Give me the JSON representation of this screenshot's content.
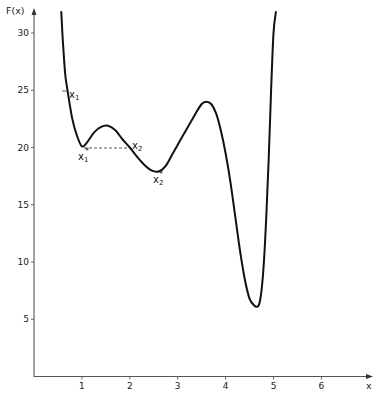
{
  "chart_data": {
    "type": "line",
    "title": "",
    "xlabel": "x",
    "ylabel": "F(x)",
    "xlim": [
      0,
      7
    ],
    "ylim": [
      0,
      32
    ],
    "x_ticks": [
      1,
      2,
      3,
      4,
      5,
      6
    ],
    "y_ticks": [
      5,
      10,
      15,
      20,
      25,
      30
    ],
    "x_tick_labels": [
      "1",
      "2",
      "3",
      "4",
      "5",
      "6"
    ],
    "y_tick_labels": [
      "5",
      "10",
      "15",
      "20",
      "25",
      "30"
    ],
    "grid": false,
    "legend": null,
    "series": [
      {
        "name": "F(x)",
        "x": [
          0.57,
          0.6,
          0.65,
          0.7,
          0.8,
          0.9,
          1.0,
          1.1,
          1.25,
          1.4,
          1.55,
          1.7,
          1.85,
          2.0,
          2.15,
          2.3,
          2.45,
          2.6,
          2.75,
          2.9,
          3.05,
          3.2,
          3.35,
          3.5,
          3.6,
          3.7,
          3.8,
          3.9,
          4.0,
          4.1,
          4.2,
          4.3,
          4.4,
          4.5,
          4.6,
          4.65,
          4.7,
          4.75,
          4.8,
          4.85,
          4.9,
          4.95,
          5.0,
          5.05
        ],
        "y": [
          32,
          29.5,
          26.5,
          25,
          22.5,
          21,
          20.1,
          20.4,
          21.3,
          21.8,
          21.9,
          21.5,
          20.7,
          20,
          19.2,
          18.5,
          18.0,
          17.9,
          18.4,
          19.5,
          20.6,
          21.7,
          22.8,
          23.8,
          24.0,
          23.8,
          23.0,
          21.5,
          19.5,
          17,
          14,
          11,
          8.5,
          6.8,
          6.2,
          6.1,
          6.3,
          7.5,
          10,
          14,
          19,
          25,
          30,
          32
        ]
      }
    ],
    "annotations": [
      {
        "text": "x1",
        "x": 0.65,
        "y": 25,
        "note": "starting point x1 on curve"
      },
      {
        "text": "x1*",
        "x": 1.0,
        "y": 20,
        "note": "local minimum"
      },
      {
        "text": "x2",
        "x": 2.0,
        "y": 20,
        "note": "point at same level as x1*"
      },
      {
        "text": "x2*",
        "x": 2.6,
        "y": 18,
        "note": "second local minimum"
      }
    ],
    "reference_lines": [
      {
        "type": "dashed",
        "from": [
          1.0,
          20
        ],
        "to": [
          2.0,
          20
        ]
      }
    ]
  },
  "labels": {
    "y_axis": "F(x)",
    "x_axis": "x",
    "x1": "x",
    "x1_sub": "1",
    "x1star": "x",
    "x1star_sub": "1",
    "x2": "x",
    "x2_sub": "2",
    "x2star": "x",
    "x2star_sub": "2",
    "star": "*"
  }
}
